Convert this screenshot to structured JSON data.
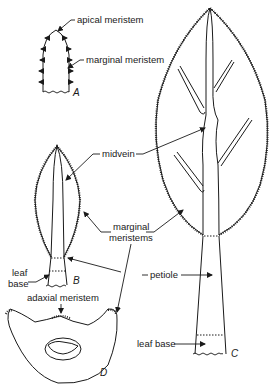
{
  "figure": {
    "panels": [
      {
        "id": "A",
        "label": "A",
        "description": "young leaf primordium"
      },
      {
        "id": "B",
        "label": "B",
        "description": "young leaf with midvein and marginal meristems"
      },
      {
        "id": "C",
        "label": "C",
        "description": "mature leaf with blade, veins, petiole and leaf base"
      },
      {
        "id": "D",
        "label": "D",
        "description": "cross-section of leaf base"
      }
    ],
    "labels": {
      "apical_meristem": "apical meristem",
      "marginal_meristem": "marginal meristem",
      "midvein": "midvein",
      "marginal_meristems_line1": "marginal",
      "marginal_meristems_line2": "meristems",
      "leaf_base_b_line1": "leaf",
      "leaf_base_b_line2": "base",
      "adaxial_meristem": "adaxial meristem",
      "petiole": "petiole",
      "leaf_base_c": "leaf base"
    }
  }
}
